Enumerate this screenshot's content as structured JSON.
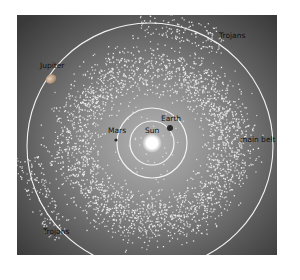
{
  "diagram": {
    "type": "solar-system-asteroid-belt",
    "colors": {
      "background_center": "#a9a9a9",
      "background_edge": "#3f3f3f",
      "orbit": "#f2f2f2",
      "asteroid": "#f0f0f0",
      "sun": "#ffffff",
      "planet_dark": "#2a2a2a",
      "jupiter": "#c9a98a",
      "label": "#111111"
    },
    "labels": {
      "jupiter": "Jupiter",
      "trojans_top": "Trojans",
      "trojans_bottom": "Trojans",
      "earth": "Earth",
      "mars": "Mars",
      "sun": "Sun",
      "main_belt": "main belt"
    },
    "bodies": [
      {
        "name": "Sun",
        "x": 152,
        "y": 143
      },
      {
        "name": "Earth",
        "x": 170,
        "y": 127
      },
      {
        "name": "Mars",
        "x": 116,
        "y": 139
      },
      {
        "name": "Jupiter",
        "x": 51,
        "y": 79
      }
    ],
    "orbits": [
      {
        "name": "Earth orbit",
        "r": 22
      },
      {
        "name": "Mars orbit",
        "r": 35
      },
      {
        "name": "Jupiter orbit",
        "r": 123
      }
    ]
  }
}
